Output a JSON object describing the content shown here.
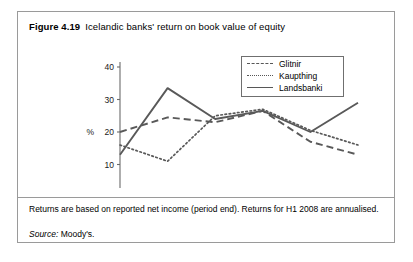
{
  "figure": {
    "number": "Figure 4.19",
    "title": "Icelandic banks' return on book value of equity",
    "footnote": "Returns are based on reported net income (period end). Returns for H1 2008 are annualised.",
    "source_keyword": "Source:",
    "source_value": "Moody's."
  },
  "legend": {
    "position": "inside-top-right",
    "entries": [
      {
        "label": "Glitnir",
        "style": "dashed",
        "icon": "dashed-line-swatch-icon"
      },
      {
        "label": "Kaupthing",
        "style": "dotted",
        "icon": "dotted-line-swatch-icon"
      },
      {
        "label": "Landsbanki",
        "style": "solid",
        "icon": "solid-line-swatch-icon"
      }
    ]
  },
  "chart_data": {
    "type": "line",
    "title": "Icelandic banks' return on book value of equity",
    "subtitle": "",
    "xlabel": "",
    "ylabel": "%",
    "categories": [
      "2003",
      "2004",
      "2005",
      "2006",
      "2007",
      "H1 2008"
    ],
    "ylim": [
      0,
      40
    ],
    "yticks": [
      0,
      10,
      20,
      30,
      40
    ],
    "ytick_labels": [
      "0",
      "10",
      "20",
      "30",
      "40"
    ],
    "grid": false,
    "legend_position": "inside-top-right",
    "line_color": "#595959",
    "series": [
      {
        "name": "Glitnir",
        "style": "dashed",
        "values": [
          20,
          24.5,
          23,
          26.5,
          17,
          13
        ]
      },
      {
        "name": "Kaupthing",
        "style": "dotted",
        "values": [
          16,
          11,
          25,
          27,
          20.5,
          16
        ]
      },
      {
        "name": "Landsbanki",
        "style": "solid",
        "values": [
          13,
          33.5,
          24,
          26.5,
          20,
          29
        ]
      }
    ],
    "annotations": [
      "Returns are based on reported net income (period end). Returns for H1 2008 are annualised.",
      "Source: Moody's."
    ]
  }
}
